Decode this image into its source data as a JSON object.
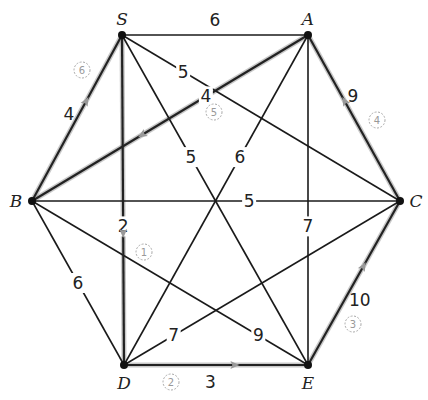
{
  "diagram": {
    "type": "weighted-graph",
    "vertices": [
      {
        "id": "S",
        "label": "S",
        "x": 122,
        "y": 35
      },
      {
        "id": "A",
        "label": "A",
        "x": 308,
        "y": 35
      },
      {
        "id": "B",
        "label": "B",
        "x": 32,
        "y": 201
      },
      {
        "id": "C",
        "label": "C",
        "x": 400,
        "y": 201
      },
      {
        "id": "D",
        "label": "D",
        "x": 124,
        "y": 365
      },
      {
        "id": "E",
        "label": "E",
        "x": 308,
        "y": 365
      }
    ],
    "edges": [
      {
        "from": "S",
        "to": "A",
        "weight": "6"
      },
      {
        "from": "S",
        "to": "B",
        "weight": "4"
      },
      {
        "from": "S",
        "to": "C",
        "weight": "5"
      },
      {
        "from": "S",
        "to": "D",
        "weight": "2"
      },
      {
        "from": "S",
        "to": "E",
        "weight": "5"
      },
      {
        "from": "A",
        "to": "B",
        "weight": "4"
      },
      {
        "from": "A",
        "to": "C",
        "weight": "9"
      },
      {
        "from": "A",
        "to": "D",
        "weight": "6"
      },
      {
        "from": "A",
        "to": "E",
        "weight": "7"
      },
      {
        "from": "B",
        "to": "C",
        "weight": "5"
      },
      {
        "from": "B",
        "to": "D",
        "weight": "6"
      },
      {
        "from": "B",
        "to": "E",
        "weight": "9"
      },
      {
        "from": "C",
        "to": "D",
        "weight": "7"
      },
      {
        "from": "C",
        "to": "E",
        "weight": "10"
      },
      {
        "from": "D",
        "to": "E",
        "weight": "3"
      }
    ],
    "highlighted_tour": [
      {
        "step": "1",
        "from": "S",
        "to": "D"
      },
      {
        "step": "2",
        "from": "D",
        "to": "E"
      },
      {
        "step": "3",
        "from": "E",
        "to": "C"
      },
      {
        "step": "4",
        "from": "C",
        "to": "A"
      },
      {
        "step": "5",
        "from": "A",
        "to": "B"
      },
      {
        "step": "6",
        "from": "B",
        "to": "S"
      }
    ]
  }
}
